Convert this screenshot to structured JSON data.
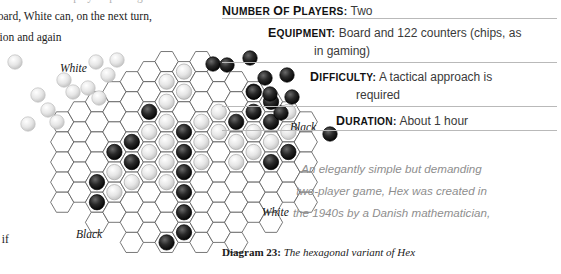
{
  "left_column": {
    "clipped_top_line": "the board if both players pass again",
    "line_1": "board, White can, on the next turn,",
    "line_2": "osition and again",
    "line_3": "en if"
  },
  "info_panel": {
    "entries": [
      {
        "label": "Number of players:",
        "value": "Two",
        "continuation": ""
      },
      {
        "label": "Equipment:",
        "value": "Board and 122 counters (chips, as",
        "continuation": "in gaming)"
      },
      {
        "label": "Difficulty:",
        "value": "A tactical approach is",
        "continuation": "required"
      },
      {
        "label": "Duration:",
        "value": "About 1 hour",
        "continuation": ""
      }
    ]
  },
  "blurb": {
    "lines": [
      "An elegantly simple but demanding",
      "two-player game, Hex was created in",
      "the 1940s by a Danish mathematician,"
    ]
  },
  "caption": {
    "number": "Diagram 23:",
    "text": "The hexagonal variant of Hex"
  },
  "board_labels": {
    "white_top": "White",
    "black_right": "Black",
    "white_bottom": "White",
    "black_bottom": "Black"
  },
  "colors": {
    "rule": "#b9b9b9",
    "hex_stroke": "#555555",
    "blurb_text": "#8e8e8e",
    "black_stone": "#1a1a1a",
    "white_stone": "#e8e8e8",
    "label_text": "#111111",
    "value_text": "#3a3a3a"
  },
  "board": {
    "hex_radius": 11.6,
    "origin_x": 184,
    "origin_y": 152,
    "columns": 15,
    "note": "rhombus hex board, diagram 23",
    "stones": [
      {
        "col": -5,
        "row": 1,
        "color": "black"
      },
      {
        "col": -5,
        "row": 2,
        "color": "black"
      },
      {
        "col": -4,
        "row": 0,
        "color": "black"
      },
      {
        "col": -4,
        "row": 1,
        "color": "white"
      },
      {
        "col": -4,
        "row": 2,
        "color": "white"
      },
      {
        "col": -3,
        "row": -1,
        "color": "black"
      },
      {
        "col": -3,
        "row": 0,
        "color": "black"
      },
      {
        "col": -3,
        "row": 1,
        "color": "white"
      },
      {
        "col": -2,
        "row": -2,
        "color": "black"
      },
      {
        "col": -2,
        "row": -1,
        "color": "white"
      },
      {
        "col": -2,
        "row": 0,
        "color": "white"
      },
      {
        "col": -2,
        "row": 1,
        "color": "white"
      },
      {
        "col": -1,
        "row": -4,
        "color": "white"
      },
      {
        "col": -1,
        "row": -3,
        "color": "white"
      },
      {
        "col": -1,
        "row": -2,
        "color": "white"
      },
      {
        "col": -1,
        "row": -1,
        "color": "white"
      },
      {
        "col": -1,
        "row": 0,
        "color": "white"
      },
      {
        "col": -1,
        "row": 1,
        "color": "white"
      },
      {
        "col": 0,
        "row": -5,
        "color": "white"
      },
      {
        "col": 0,
        "row": -4,
        "color": "white"
      },
      {
        "col": 0,
        "row": -3,
        "color": "white"
      },
      {
        "col": 0,
        "row": -1,
        "color": "black"
      },
      {
        "col": 0,
        "row": 0,
        "color": "black"
      },
      {
        "col": 0,
        "row": 1,
        "color": "black"
      },
      {
        "col": 0,
        "row": 2,
        "color": "black"
      },
      {
        "col": 0,
        "row": 3,
        "color": "black"
      },
      {
        "col": 0,
        "row": 4,
        "color": "black"
      },
      {
        "col": -1,
        "row": 4,
        "color": "black"
      },
      {
        "col": 1,
        "row": -2,
        "color": "white"
      },
      {
        "col": 1,
        "row": -1,
        "color": "white"
      },
      {
        "col": 1,
        "row": 0,
        "color": "white"
      },
      {
        "col": 2,
        "row": -2,
        "color": "white"
      },
      {
        "col": 2,
        "row": -1,
        "color": "white"
      },
      {
        "col": 3,
        "row": -2,
        "color": "black"
      },
      {
        "col": 3,
        "row": -1,
        "color": "white"
      },
      {
        "col": 3,
        "row": 0,
        "color": "white"
      },
      {
        "col": 4,
        "row": -3,
        "color": "black"
      },
      {
        "col": 4,
        "row": -2,
        "color": "black"
      },
      {
        "col": 4,
        "row": -1,
        "color": "white"
      },
      {
        "col": 4,
        "row": 0,
        "color": "white"
      },
      {
        "col": 5,
        "row": -3,
        "color": "black"
      },
      {
        "col": 5,
        "row": -2,
        "color": "black"
      },
      {
        "col": 5,
        "row": -1,
        "color": "white"
      },
      {
        "col": 5,
        "row": 0,
        "color": "black"
      },
      {
        "col": 6,
        "row": -2,
        "color": "white"
      },
      {
        "col": 6,
        "row": -1,
        "color": "white"
      },
      {
        "col": 6,
        "row": 0,
        "color": "black"
      }
    ],
    "loose_white": [
      [
        96,
        62
      ],
      [
        108,
        75
      ],
      [
        117,
        60
      ],
      [
        64,
        80
      ],
      [
        73,
        92
      ],
      [
        88,
        88
      ],
      [
        99,
        98
      ],
      [
        38,
        95
      ],
      [
        48,
        110
      ],
      [
        57,
        122
      ],
      [
        28,
        124
      ],
      [
        15,
        62
      ]
    ],
    "loose_black": [
      [
        213,
        64
      ],
      [
        227,
        65
      ],
      [
        250,
        58
      ],
      [
        265,
        78
      ],
      [
        287,
        75
      ],
      [
        254,
        92
      ],
      [
        270,
        94
      ],
      [
        292,
        97
      ],
      [
        281,
        113
      ],
      [
        330,
        134
      ]
    ]
  }
}
